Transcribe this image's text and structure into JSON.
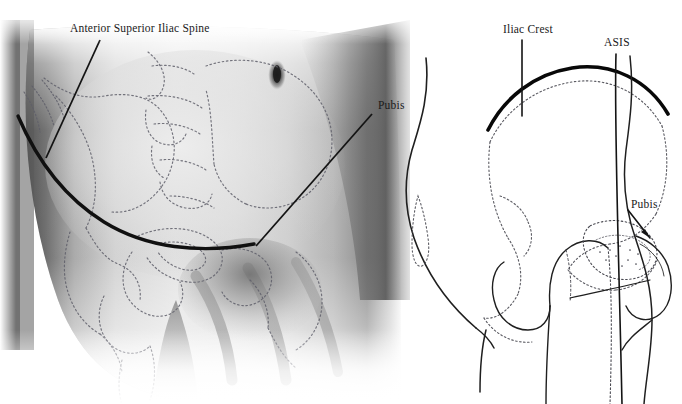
{
  "figure": {
    "background_color": "#ffffff",
    "ink_color": "#1a1a1a",
    "width": 682,
    "height": 404
  },
  "panels": [
    {
      "id": "photo",
      "name": "anterior-abdomen-photograph",
      "description": "Airbrushed photographic rendering of a lower abdomen and groin with dotted pelvic bone outlines superimposed and a solid curved line marking the iliac crest / inguinal region",
      "render_style": "grayscale-airbrush",
      "labels": [
        {
          "id": "asis-left",
          "text": "Anterior Superior Iliac Spine",
          "leader": "diagonal line down-left to the anterior superior iliac spine"
        },
        {
          "id": "pubis-left",
          "text": "Pubis",
          "leader": "diagonal line down-left to the pubic region"
        }
      ]
    },
    {
      "id": "drawing",
      "name": "lateral-hip-line-drawing",
      "description": "Line drawing of a lateral view of the hip and pelvis showing body contour, iliac crest as a heavy arc, dotted pelvic bone and femur outlines, hip joint, and external genitalia contour",
      "render_style": "line-art",
      "labels": [
        {
          "id": "iliac-crest",
          "text": "Iliac Crest",
          "leader": "vertical line down to the crest of the ilium"
        },
        {
          "id": "asis-right",
          "text": "ASIS",
          "leader": "near-vertical line down to the anterior superior iliac spine"
        },
        {
          "id": "pubis-right",
          "text": "Pubis",
          "leader": "short diagonal line down-left to the pubic region"
        }
      ]
    }
  ],
  "anatomy_terms": {
    "asis_full": "Anterior Superior Iliac Spine",
    "asis_abbrev": "ASIS",
    "iliac_crest": "Iliac Crest",
    "pubis": "Pubis"
  }
}
